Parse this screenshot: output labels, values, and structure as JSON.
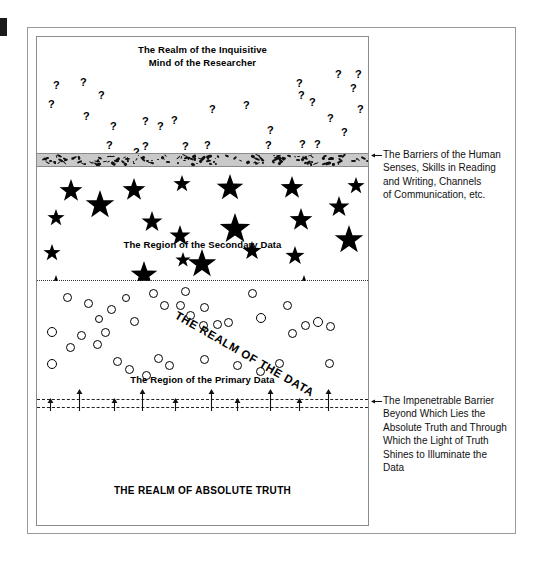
{
  "figure": {
    "edge_mark": "black-edge-tick"
  },
  "diagram": {
    "regions": [
      {
        "key": "inquisitive",
        "label": "The Realm of the Inquisitive\nMind of the Researcher",
        "glyph": "question-mark"
      },
      {
        "key": "secondary",
        "label": "The Region of the Secondary Data",
        "glyph": "star"
      },
      {
        "key": "primary",
        "label": "The Region of the Primary Data",
        "glyph": "circle"
      },
      {
        "key": "truth",
        "label": "THE REALM OF ABSOLUTE TRUTH",
        "glyph": "none"
      }
    ],
    "labels": {
      "inquisitive_line1": "The Realm of the Inquisitive",
      "inquisitive_line2": "Mind of the Researcher",
      "secondary": "The Region of the Secondary Data",
      "primary": "The Region of the Primary Data",
      "truth": "THE REALM OF ABSOLUTE TRUTH",
      "diagonal": "THE REALM OF THE DATA"
    },
    "barriers": {
      "human_senses_band": "speckled-gray-band",
      "data_divider": "dotted-line",
      "impenetrable": "double-dashed-line-with-up-arrows"
    }
  },
  "annotations": [
    {
      "id": "barriers-of-human-senses",
      "text": "The Barriers of the Human Senses, Skills in Reading and Writing, Channels of Communication, etc.",
      "lines": [
        "The Barriers of the Human",
        "Senses, Skills in Reading",
        "and Writing, Channels",
        "of Communication, etc."
      ]
    },
    {
      "id": "impenetrable-barrier",
      "text": "The Impenetrable Barrier Beyond Which Lies the Absolute Truth and Through Which the Light of Truth Shines  to Illuminate the Data",
      "lines": [
        "The Impenetrable Barrier",
        "Beyond Which Lies the",
        "Absolute Truth and Through",
        "Which the Light of Truth",
        "Shines  to Illuminate the",
        "Data"
      ]
    }
  ],
  "colors": {
    "ink": "#000000",
    "frame": "#9a9a9a",
    "barrier_band": "#c9c9c9",
    "background": "#ffffff"
  },
  "glyph_positions": {
    "question_marks": [
      [
        16,
        43
      ],
      [
        43,
        40
      ],
      [
        61,
        53
      ],
      [
        11,
        62
      ],
      [
        46,
        74
      ],
      [
        73,
        84
      ],
      [
        69,
        103
      ],
      [
        96,
        110
      ],
      [
        105,
        79
      ],
      [
        120,
        84
      ],
      [
        134,
        78
      ],
      [
        105,
        104
      ],
      [
        145,
        104
      ],
      [
        167,
        103
      ],
      [
        172,
        67
      ],
      [
        206,
        63
      ],
      [
        230,
        88
      ],
      [
        228,
        103
      ],
      [
        262,
        102
      ],
      [
        277,
        102
      ],
      [
        261,
        53
      ],
      [
        272,
        60
      ],
      [
        259,
        41
      ],
      [
        290,
        76
      ],
      [
        304,
        90
      ],
      [
        320,
        67
      ],
      [
        313,
        46
      ],
      [
        298,
        32
      ],
      [
        318,
        32
      ],
      [
        195,
        122
      ],
      [
        306,
        122
      ],
      [
        22,
        126
      ],
      [
        59,
        115
      ]
    ],
    "stars": [
      [
        22,
        14,
        12
      ],
      [
        48,
        25,
        15
      ],
      [
        85,
        13,
        12
      ],
      [
        104,
        46,
        11
      ],
      [
        136,
        10,
        9
      ],
      [
        132,
        60,
        11
      ],
      [
        179,
        9,
        14
      ],
      [
        182,
        48,
        16
      ],
      [
        150,
        84,
        15
      ],
      [
        205,
        76,
        10
      ],
      [
        243,
        11,
        12
      ],
      [
        248,
        81,
        10
      ],
      [
        252,
        43,
        12
      ],
      [
        291,
        31,
        11
      ],
      [
        297,
        60,
        15
      ],
      [
        10,
        44,
        9
      ],
      [
        6,
        79,
        9
      ],
      [
        10,
        110,
        9
      ],
      [
        93,
        96,
        14
      ],
      [
        256,
        110,
        11
      ],
      [
        138,
        87,
        8
      ],
      [
        310,
        12,
        9
      ]
    ],
    "circles": [
      [
        26,
        12,
        9
      ],
      [
        47,
        18,
        9
      ],
      [
        70,
        24,
        9
      ],
      [
        85,
        13,
        8
      ],
      [
        58,
        34,
        8
      ],
      [
        93,
        36,
        9
      ],
      [
        112,
        8,
        9
      ],
      [
        123,
        20,
        9
      ],
      [
        139,
        20,
        9
      ],
      [
        144,
        6,
        9
      ],
      [
        149,
        30,
        9
      ],
      [
        163,
        22,
        9
      ],
      [
        162,
        40,
        9
      ],
      [
        176,
        39,
        9
      ],
      [
        187,
        37,
        9
      ],
      [
        211,
        8,
        9
      ],
      [
        219,
        32,
        10
      ],
      [
        246,
        20,
        9
      ],
      [
        251,
        48,
        9
      ],
      [
        264,
        40,
        9
      ],
      [
        276,
        36,
        10
      ],
      [
        289,
        41,
        9
      ],
      [
        10,
        46,
        10
      ],
      [
        40,
        50,
        9
      ],
      [
        56,
        59,
        9
      ],
      [
        29,
        62,
        9
      ],
      [
        64,
        47,
        9
      ],
      [
        10,
        78,
        10
      ],
      [
        76,
        76,
        9
      ],
      [
        88,
        84,
        9
      ],
      [
        105,
        90,
        9
      ],
      [
        117,
        73,
        9
      ],
      [
        128,
        80,
        9
      ],
      [
        163,
        74,
        9
      ],
      [
        196,
        80,
        9
      ],
      [
        219,
        86,
        9
      ],
      [
        238,
        78,
        9
      ],
      [
        288,
        78,
        9
      ]
    ],
    "arrow_x": [
      13,
      42,
      77,
      105,
      138,
      174,
      200,
      233,
      262,
      291
    ]
  }
}
